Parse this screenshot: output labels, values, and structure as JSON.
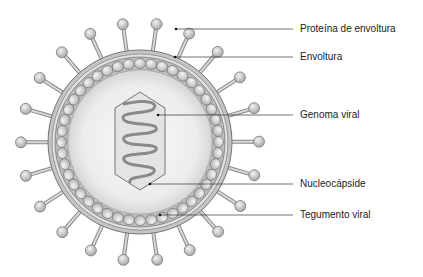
{
  "diagram": {
    "type": "labeled-virus-structure",
    "labels": [
      {
        "id": "envelope-protein",
        "text": "Proteína de envoltura",
        "y": 29,
        "target": [
          176,
          29
        ]
      },
      {
        "id": "envelope",
        "text": "Envoltura",
        "y": 57,
        "target": [
          175,
          57
        ]
      },
      {
        "id": "viral-genome",
        "text": "Genoma viral",
        "y": 115,
        "target": [
          158,
          115
        ]
      },
      {
        "id": "nucleocapsid",
        "text": "Nucleocápside",
        "y": 184,
        "target": [
          150,
          184
        ]
      },
      {
        "id": "viral-tegument",
        "text": "Tegumento viral",
        "y": 215,
        "target": [
          160,
          215
        ]
      }
    ],
    "colors": {
      "membrane": "#9a9a9a",
      "interior": "#eeeeee",
      "capsomere": "#d8d8d8",
      "leader_line": "#333333",
      "text": "#222222"
    }
  }
}
